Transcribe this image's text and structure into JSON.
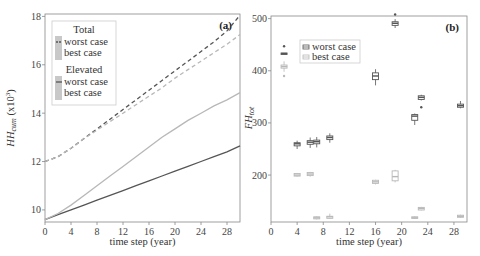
{
  "chart_data": [
    {
      "type": "line",
      "panel_label": "(a)",
      "title": "",
      "xlabel": "time step (year)",
      "ylabel": "HH_cum (x10^3)",
      "ylabel_main": "HH",
      "ylabel_sub": "cum",
      "ylabel_unit": " (x10",
      "ylabel_exp": "3",
      "ylabel_close": ")",
      "xlim": [
        0,
        30
      ],
      "ylim": [
        9.5,
        18.1
      ],
      "xticks": [
        0,
        4,
        8,
        12,
        16,
        20,
        24,
        28
      ],
      "yticks": [
        10,
        12,
        14,
        16,
        18
      ],
      "grid": false,
      "legend": {
        "position": "upper left",
        "groups": [
          {
            "title": "Total",
            "entries": [
              "worst case",
              "best case"
            ],
            "style": "dashed"
          },
          {
            "title": "Elevated",
            "entries": [
              "worst case",
              "best case"
            ],
            "style": "solid"
          }
        ]
      },
      "x": [
        0,
        2,
        4,
        6,
        8,
        10,
        12,
        14,
        16,
        18,
        20,
        22,
        24,
        26,
        28,
        30
      ],
      "series": [
        {
          "name": "Total worst case",
          "style": "dashed",
          "color": "#555555",
          "values": [
            12.0,
            12.2,
            12.55,
            12.95,
            13.35,
            13.75,
            14.15,
            14.55,
            14.95,
            15.35,
            15.75,
            16.15,
            16.55,
            16.95,
            17.4,
            18.05
          ]
        },
        {
          "name": "Total best case",
          "style": "dashed",
          "color": "#b8b8b8",
          "values": [
            12.0,
            12.2,
            12.55,
            12.95,
            13.3,
            13.65,
            14.0,
            14.35,
            14.7,
            15.05,
            15.45,
            15.8,
            16.15,
            16.5,
            16.85,
            17.25
          ]
        },
        {
          "name": "Elevated worst case",
          "style": "solid",
          "color": "#555555",
          "values": [
            9.6,
            9.8,
            10.0,
            10.2,
            10.4,
            10.6,
            10.8,
            11.0,
            11.2,
            11.4,
            11.6,
            11.8,
            12.0,
            12.2,
            12.4,
            12.65
          ]
        },
        {
          "name": "Elevated best case",
          "style": "solid",
          "color": "#b8b8b8",
          "values": [
            9.6,
            9.85,
            10.2,
            10.6,
            11.0,
            11.4,
            11.8,
            12.2,
            12.6,
            13.0,
            13.35,
            13.7,
            14.0,
            14.3,
            14.55,
            14.85
          ]
        }
      ]
    },
    {
      "type": "box",
      "panel_label": "(b)",
      "title": "",
      "xlabel": "time step (year)",
      "ylabel": "FH_tot",
      "ylabel_main": "FH",
      "ylabel_sub": "tot",
      "xlim": [
        0,
        30
      ],
      "ylim": [
        110,
        505
      ],
      "xticks": [
        0,
        4,
        8,
        12,
        16,
        20,
        24,
        28
      ],
      "yticks": [
        200,
        300,
        400,
        500
      ],
      "grid": false,
      "legend": {
        "position": "upper left",
        "entries": [
          "worst case",
          "best case"
        ]
      },
      "series": [
        {
          "name": "worst case",
          "color": "#555555",
          "boxes": [
            {
              "x": 2,
              "median": 433,
              "q1": 432,
              "q3": 434,
              "whislo": 432,
              "whishi": 434,
              "outliers": [
                447
              ]
            },
            {
              "x": 4,
              "median": 260,
              "q1": 256,
              "q3": 262,
              "whislo": 250,
              "whishi": 266,
              "outliers": []
            },
            {
              "x": 6,
              "median": 263,
              "q1": 259,
              "q3": 266,
              "whislo": 252,
              "whishi": 272,
              "outliers": []
            },
            {
              "x": 7,
              "median": 264,
              "q1": 260,
              "q3": 267,
              "whislo": 253,
              "whishi": 273,
              "outliers": []
            },
            {
              "x": 9,
              "median": 272,
              "q1": 268,
              "q3": 275,
              "whislo": 262,
              "whishi": 280,
              "outliers": []
            },
            {
              "x": 16,
              "median": 390,
              "q1": 383,
              "q3": 396,
              "whislo": 372,
              "whishi": 403,
              "outliers": []
            },
            {
              "x": 19,
              "median": 491,
              "q1": 487,
              "q3": 494,
              "whislo": 482,
              "whishi": 499,
              "outliers": [
                508
              ]
            },
            {
              "x": 22,
              "median": 313,
              "q1": 305,
              "q3": 316,
              "whislo": 296,
              "whishi": 318,
              "outliers": []
            },
            {
              "x": 23,
              "median": 349,
              "q1": 345,
              "q3": 352,
              "whislo": 343,
              "whishi": 354,
              "outliers": [
                330
              ]
            },
            {
              "x": 29,
              "median": 333,
              "q1": 330,
              "q3": 336,
              "whislo": 328,
              "whishi": 342,
              "outliers": []
            }
          ]
        },
        {
          "name": "best case",
          "color": "#b8b8b8",
          "boxes": [
            {
              "x": 2,
              "median": 408,
              "q1": 405,
              "q3": 411,
              "whislo": 398,
              "whishi": 418,
              "outliers": [
                390
              ]
            },
            {
              "x": 4,
              "median": 200,
              "q1": 198,
              "q3": 203,
              "whislo": 197,
              "whishi": 204,
              "outliers": []
            },
            {
              "x": 6,
              "median": 202,
              "q1": 199,
              "q3": 205,
              "whislo": 197,
              "whishi": 206,
              "outliers": []
            },
            {
              "x": 7,
              "median": 118,
              "q1": 116,
              "q3": 120,
              "whislo": 115,
              "whishi": 121,
              "outliers": []
            },
            {
              "x": 9,
              "median": 120,
              "q1": 117,
              "q3": 121,
              "whislo": 116,
              "whishi": 126,
              "outliers": []
            },
            {
              "x": 16,
              "median": 187,
              "q1": 184,
              "q3": 190,
              "whislo": 182,
              "whishi": 191,
              "outliers": []
            },
            {
              "x": 19,
              "median": 197,
              "q1": 189,
              "q3": 208,
              "whislo": 186,
              "whishi": 210,
              "outliers": []
            },
            {
              "x": 22,
              "median": 118,
              "q1": 117,
              "q3": 120,
              "whislo": 116,
              "whishi": 121,
              "outliers": []
            },
            {
              "x": 23,
              "median": 136,
              "q1": 133,
              "q3": 138,
              "whislo": 132,
              "whishi": 139,
              "outliers": []
            },
            {
              "x": 29,
              "median": 121,
              "q1": 119,
              "q3": 123,
              "whislo": 118,
              "whishi": 124,
              "outliers": []
            }
          ]
        }
      ]
    }
  ],
  "colors": {
    "dark": "#555555",
    "light": "#b8b8b8",
    "axis": "#888888",
    "legend_border": "#cccccc"
  }
}
